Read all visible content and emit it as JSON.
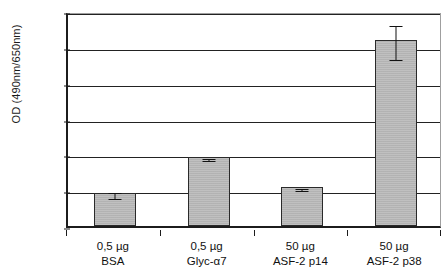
{
  "chart_data": {
    "type": "bar",
    "title": "",
    "xlabel": "",
    "ylabel": "OD (490nm/650nm)",
    "categories": [
      "0,5 µg BSA",
      "0,5 µg Glyc-α7",
      "50 µg ASF-2 p14",
      "50 µg ASF-2 p38"
    ],
    "category_lines": [
      [
        "0,5 µg",
        "BSA"
      ],
      [
        "0,5 µg",
        "Glyc-α7"
      ],
      [
        "50 µg",
        "ASF-2 p14"
      ],
      [
        "50 µg",
        "ASF-2 p38"
      ]
    ],
    "values": [
      0.0185,
      0.0385,
      0.022,
      0.104
    ],
    "errors": [
      0.0015,
      0.0008,
      0.0006,
      0.0095
    ],
    "ylim": [
      0,
      0.12
    ],
    "ytick_values": [
      0,
      0.02,
      0.04,
      0.06,
      0.08,
      0.1,
      0.12
    ],
    "ytick_labels": [
      "0",
      "0,02",
      "0,04",
      "0,06",
      "0,08",
      "0,1",
      "0,12"
    ],
    "grid": "horizontal",
    "legend": "none",
    "bar_color": "#b9b9b9",
    "bar_edge_color": "#2a2a2a",
    "axis_color": "#1c1c1c",
    "gridline_color": "#222222",
    "frame_color": "#9f9f9f",
    "background_color": "#ffffff",
    "annotations": []
  }
}
